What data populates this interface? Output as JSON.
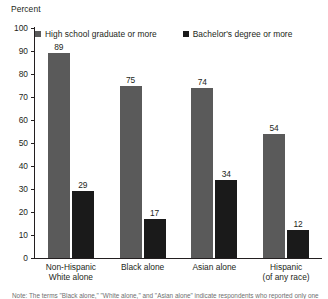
{
  "chart_data": {
    "type": "bar",
    "title": "",
    "ylabel": "Percent",
    "xlabel": "",
    "ylim": [
      0,
      100
    ],
    "yticks": [
      0,
      10,
      20,
      30,
      40,
      50,
      60,
      70,
      80,
      90,
      100
    ],
    "grid": false,
    "legend_position": "top-inside",
    "categories": [
      "Non-Hispanic White alone",
      "Black alone",
      "Asian alone",
      "Hispanic (of any race)"
    ],
    "category_lines": [
      [
        "Non-Hispanic",
        "White alone"
      ],
      [
        "Black alone"
      ],
      [
        "Asian alone"
      ],
      [
        "Hispanic",
        "(of any race)"
      ]
    ],
    "series": [
      {
        "name": "High school graduate or more",
        "color": "#5a5a5a",
        "values": [
          89,
          75,
          74,
          54
        ]
      },
      {
        "name": "Bachelor's degree or more",
        "color": "#1a1a1a",
        "values": [
          29,
          17,
          34,
          12
        ]
      }
    ]
  },
  "note": {
    "text": "Note: The terms \"Black alone,\" \"White alone,\" and \"Asian alone\" indicate respondents who reported only one race."
  }
}
